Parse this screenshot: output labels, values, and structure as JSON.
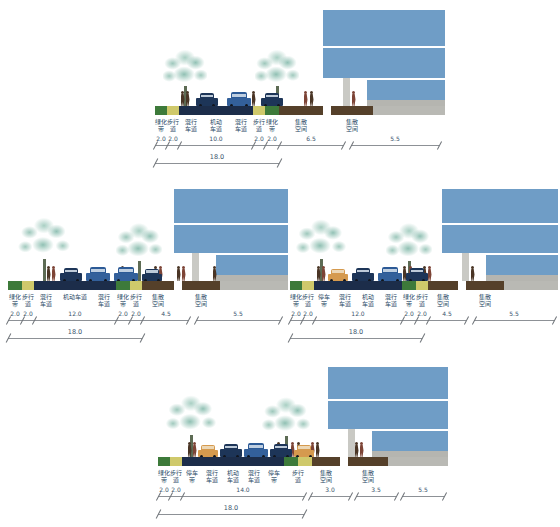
{
  "figure": {
    "colors": {
      "greenbelt": "#3d7a3a",
      "sidewalk": "#cfc96b",
      "roadway": "#1c2d4a",
      "plaza": "#55402a",
      "building_glass": "#6f9dc6",
      "building_column": "#c9c9c4",
      "label_text": "#2a4a66",
      "dimension_line": "#8d9196"
    }
  },
  "sections": [
    {
      "id": "section-top",
      "name": "18米路幅 机动车道10米",
      "zones": [
        {
          "label": "绿化\n带",
          "value": "2.0",
          "type": "green",
          "width": 10
        },
        {
          "label": "步行\n道",
          "value": "2.0",
          "type": "walk",
          "width": 10
        },
        {
          "label": "混行\n车道",
          "value": "",
          "type": "road",
          "width": 22
        },
        {
          "label": "机动\n车道",
          "value": "10.0",
          "type": "road",
          "width": 24
        },
        {
          "label": "混行\n车道",
          "value": "",
          "type": "road",
          "width": 22
        },
        {
          "label": "步行\n道",
          "value": "2.0",
          "type": "walk",
          "width": 10
        },
        {
          "label": "绿化\n带",
          "value": "2.0",
          "type": "green",
          "width": 10
        },
        {
          "label": "集散\n空间",
          "value": "6.5",
          "type": "plaza",
          "width": 38
        },
        {
          "label": "",
          "value": "",
          "type": "gap",
          "width": 6
        },
        {
          "label": "集散\n空间",
          "value": "5.5",
          "type": "plaza",
          "width": 33
        }
      ],
      "roadway_total": "18.0",
      "sub_dims": [
        "2.0",
        "2.0",
        "10.0",
        "2.0",
        "2.0",
        "6.5",
        "5.5"
      ]
    },
    {
      "id": "section-mid-left",
      "name": "18米路幅 机动车道12米 集散空间4.5米",
      "zones": [
        {
          "label": "绿化\n带",
          "value": "2.0",
          "type": "green",
          "width": 10
        },
        {
          "label": "步行\n道",
          "value": "2.0",
          "type": "walk",
          "width": 10
        },
        {
          "label": "混行\n车道",
          "value": "",
          "type": "road",
          "width": 22
        },
        {
          "label": "机动车道",
          "value": "12.0",
          "type": "road",
          "width": 34
        },
        {
          "label": "混行\n车道",
          "value": "",
          "type": "road",
          "width": 22
        },
        {
          "label": "绿化\n带",
          "value": "2.0",
          "type": "green",
          "width": 10
        },
        {
          "label": "步行\n道",
          "value": "2.0",
          "type": "walk",
          "width": 10
        },
        {
          "label": "集散\n空间",
          "value": "4.5",
          "type": "plaza",
          "width": 30
        },
        {
          "label": "",
          "value": "",
          "type": "gap",
          "width": 6
        },
        {
          "label": "集散\n空间",
          "value": "5.5",
          "type": "plaza",
          "width": 33
        }
      ],
      "roadway_total": "18.0",
      "sub_dims": [
        "2.0",
        "2.0",
        "12.0",
        "2.0",
        "2.0",
        "4.5",
        "5.5"
      ]
    },
    {
      "id": "section-mid-right",
      "name": "18米路幅 停车带 机动车道12米",
      "zones": [
        {
          "label": "绿化\n带",
          "value": "2.0",
          "type": "green",
          "width": 10
        },
        {
          "label": "步行\n道",
          "value": "2.0",
          "type": "walk",
          "width": 10
        },
        {
          "label": "停车\n带",
          "value": "",
          "type": "road",
          "width": 18
        },
        {
          "label": "混行\n车道",
          "value": "",
          "type": "road",
          "width": 20
        },
        {
          "label": "机动\n车道",
          "value": "12.0",
          "type": "road",
          "width": 22
        },
        {
          "label": "混行\n车道",
          "value": "",
          "type": "road",
          "width": 20
        },
        {
          "label": "绿化\n带",
          "value": "2.0",
          "type": "green",
          "width": 10
        },
        {
          "label": "步行\n道",
          "value": "2.0",
          "type": "walk",
          "width": 10
        },
        {
          "label": "集散\n空间",
          "value": "4.5",
          "type": "plaza",
          "width": 30
        },
        {
          "label": "",
          "value": "",
          "type": "gap",
          "width": 6
        },
        {
          "label": "集散\n空间",
          "value": "5.5",
          "type": "plaza",
          "width": 33
        }
      ],
      "roadway_total": "18.0",
      "sub_dims": [
        "2.0",
        "2.0",
        "12.0",
        "2.0",
        "2.0",
        "4.5",
        "5.5"
      ]
    },
    {
      "id": "section-bottom",
      "name": "18米路幅 停车带 机动车道14米",
      "zones": [
        {
          "label": "绿化\n带",
          "value": "2.0",
          "type": "green",
          "width": 10
        },
        {
          "label": "步行\n道",
          "value": "2.0",
          "type": "walk",
          "width": 10
        },
        {
          "label": "停车\n带",
          "value": "",
          "type": "road",
          "width": 18
        },
        {
          "label": "混行\n车道",
          "value": "",
          "type": "road",
          "width": 18
        },
        {
          "label": "机动\n车道",
          "value": "14.0",
          "type": "road",
          "width": 20
        },
        {
          "label": "混行\n车道",
          "value": "",
          "type": "road",
          "width": 18
        },
        {
          "label": "停车\n带",
          "value": "",
          "type": "road",
          "width": 18
        },
        {
          "label": "步行\n道",
          "value": "3.0",
          "type": "walk",
          "width": 16
        },
        {
          "label": "集散\n空间",
          "value": "3.5",
          "type": "plaza",
          "width": 24
        },
        {
          "label": "",
          "value": "",
          "type": "gap",
          "width": 6
        },
        {
          "label": "集散\n空间",
          "value": "5.5",
          "type": "plaza",
          "width": 33
        }
      ],
      "roadway_total": "18.0",
      "sub_dims": [
        "2.0",
        "2.0",
        "14.0",
        "3.0",
        "3.5",
        "5.5"
      ]
    }
  ]
}
